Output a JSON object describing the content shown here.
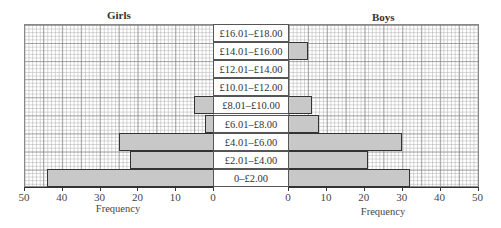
{
  "chart_data": {
    "type": "bar",
    "subtype": "back-to-back horizontal bar (population pyramid)",
    "categories": [
      "0–£2.00",
      "£2.01–£4.00",
      "£4.01–£6.00",
      "£6.01–£8.00",
      "£8.01–£10.00",
      "£10.01–£12.00",
      "£12.01–£14.00",
      "£14.01–£16.00",
      "£16.01–£18.00"
    ],
    "series": [
      {
        "name": "Girls",
        "values": [
          44,
          22,
          25,
          2,
          5,
          0,
          0,
          0,
          0
        ]
      },
      {
        "name": "Boys",
        "values": [
          32,
          21,
          30,
          8,
          6,
          0,
          0,
          5,
          0
        ]
      }
    ],
    "title_left": "Girls",
    "title_right": "Boys",
    "xlabel_left": "Frequency",
    "xlabel_right": "Frequency",
    "xlim": [
      0,
      50
    ],
    "xticks": [
      0,
      10,
      20,
      30,
      40,
      50
    ],
    "grid": true,
    "bar_color": "#c8c8c8",
    "bar_edge_color": "#333333"
  },
  "labels": {
    "girls": "Girls",
    "boys": "Boys",
    "freq_left": "Frequency",
    "freq_right": "Frequency"
  },
  "categories": [
    {
      "label": "£16.01–£18.00",
      "girls": 0,
      "boys": 0
    },
    {
      "label": "£14.01–£16.00",
      "girls": 0,
      "boys": 5
    },
    {
      "label": "£12.01–£14.00",
      "girls": 0,
      "boys": 0
    },
    {
      "label": "£10.01–£12.00",
      "girls": 0,
      "boys": 0
    },
    {
      "label": "£8.01–£10.00",
      "girls": 5,
      "boys": 6
    },
    {
      "label": "£6.01–£8.00",
      "girls": 2,
      "boys": 8
    },
    {
      "label": "£4.01–£6.00",
      "girls": 25,
      "boys": 30
    },
    {
      "label": "£2.01–£4.00",
      "girls": 22,
      "boys": 21
    },
    {
      "label": "0–£2.00",
      "girls": 44,
      "boys": 32
    }
  ],
  "ticks_left": [
    "50",
    "40",
    "30",
    "20",
    "10",
    "0"
  ],
  "ticks_right": [
    "0",
    "10",
    "20",
    "30",
    "40",
    "50"
  ]
}
